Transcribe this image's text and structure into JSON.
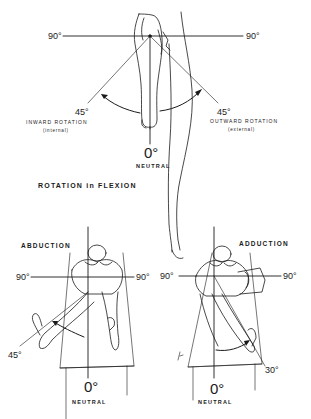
{
  "rotation_panel": {
    "title": "ROTATION in FLEXION",
    "left_angle_90": "90°",
    "right_angle_90": "90°",
    "left_angle_45": "45°",
    "right_angle_45": "45°",
    "inward_label": "INWARD ROTATION",
    "inward_sub": "(internal)",
    "outward_label": "OUTWARD ROTATION",
    "outward_sub": "(external)",
    "neutral_angle": "0°",
    "neutral_label": "NEUTRAL"
  },
  "abduction_panel": {
    "title": "ABDUCTION",
    "left_angle_90": "90°",
    "right_angle_90": "90°",
    "angle_45": "45°",
    "neutral_angle": "0°",
    "neutral_label": "NEUTRAL"
  },
  "adduction_panel": {
    "title": "ADDUCTION",
    "left_angle_90": "90°",
    "right_angle_90": "90°",
    "angle_30": "30°",
    "neutral_angle": "0°",
    "neutral_label": "NEUTRAL"
  },
  "colors": {
    "ink": "#1a1a1a",
    "background": "#ffffff"
  }
}
